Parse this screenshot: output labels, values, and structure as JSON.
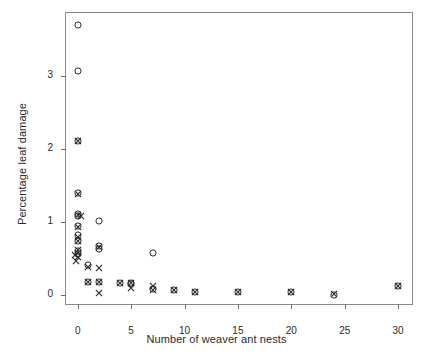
{
  "chart_data": {
    "type": "scatter",
    "title": "",
    "xlabel": "Number of weaver ant nests",
    "ylabel": "Percentage leaf damage",
    "xlim": [
      -1.1,
      31.3
    ],
    "ylim": [
      -0.12,
      3.87
    ],
    "xticks": [
      0,
      5,
      10,
      15,
      20,
      25,
      30
    ],
    "xticklabels": [
      "0",
      "5",
      "10",
      "15",
      "20",
      "25",
      "30"
    ],
    "yticks": [
      0,
      1,
      2,
      3
    ],
    "yticklabels": [
      "0",
      "1",
      "2",
      "3"
    ],
    "grid": false,
    "legend": false,
    "frame": "box",
    "series": [
      {
        "name": "circle-series",
        "marker": "circle",
        "points": [
          {
            "x": 0.0,
            "y": 3.7
          },
          {
            "x": 0.0,
            "y": 3.08
          },
          {
            "x": 0.0,
            "y": 2.12
          },
          {
            "x": 0.0,
            "y": 1.4
          },
          {
            "x": 0.0,
            "y": 1.12
          },
          {
            "x": 0.0,
            "y": 1.09
          },
          {
            "x": 0.0,
            "y": 0.95
          },
          {
            "x": 0.0,
            "y": 0.82
          },
          {
            "x": 0.0,
            "y": 0.74
          },
          {
            "x": 0.0,
            "y": 0.6
          },
          {
            "x": 0.0,
            "y": 0.57
          },
          {
            "x": 1.0,
            "y": 0.41
          },
          {
            "x": 1.0,
            "y": 0.18
          },
          {
            "x": 2.0,
            "y": 1.02
          },
          {
            "x": 2.0,
            "y": 0.67
          },
          {
            "x": 2.0,
            "y": 0.64
          },
          {
            "x": 2.0,
            "y": 0.18
          },
          {
            "x": 4.0,
            "y": 0.17
          },
          {
            "x": 5.0,
            "y": 0.17
          },
          {
            "x": 5.0,
            "y": 0.15
          },
          {
            "x": 7.0,
            "y": 0.58
          },
          {
            "x": 7.0,
            "y": 0.09
          },
          {
            "x": 9.0,
            "y": 0.07
          },
          {
            "x": 11.0,
            "y": 0.04
          },
          {
            "x": 15.0,
            "y": 0.04
          },
          {
            "x": 20.0,
            "y": 0.04
          },
          {
            "x": 24.0,
            "y": 0.01
          },
          {
            "x": 30.0,
            "y": 0.12
          }
        ]
      },
      {
        "name": "cross-series",
        "marker": "x",
        "points": [
          {
            "x": 0.0,
            "y": 2.12
          },
          {
            "x": 0.0,
            "y": 1.39
          },
          {
            "x": 0.0,
            "y": 1.1
          },
          {
            "x": 0.3,
            "y": 1.09
          },
          {
            "x": 0.0,
            "y": 0.94
          },
          {
            "x": 0.0,
            "y": 0.8
          },
          {
            "x": 0.0,
            "y": 0.74
          },
          {
            "x": 0.0,
            "y": 0.62
          },
          {
            "x": 0.0,
            "y": 0.58
          },
          {
            "x": -0.3,
            "y": 0.55
          },
          {
            "x": 0.0,
            "y": 0.52
          },
          {
            "x": -0.2,
            "y": 0.47
          },
          {
            "x": 1.0,
            "y": 0.39
          },
          {
            "x": 1.0,
            "y": 0.18
          },
          {
            "x": 2.0,
            "y": 0.38
          },
          {
            "x": 2.0,
            "y": 0.66
          },
          {
            "x": 2.0,
            "y": 0.18
          },
          {
            "x": 2.0,
            "y": 0.03
          },
          {
            "x": 4.0,
            "y": 0.17
          },
          {
            "x": 5.0,
            "y": 0.17
          },
          {
            "x": 5.0,
            "y": 0.1
          },
          {
            "x": 7.0,
            "y": 0.12
          },
          {
            "x": 7.0,
            "y": 0.07
          },
          {
            "x": 9.0,
            "y": 0.07
          },
          {
            "x": 11.0,
            "y": 0.04
          },
          {
            "x": 15.0,
            "y": 0.04
          },
          {
            "x": 20.0,
            "y": 0.04
          },
          {
            "x": 24.0,
            "y": 0.02
          },
          {
            "x": 30.0,
            "y": 0.12
          }
        ]
      }
    ],
    "marker_color": "#2b2b2b",
    "axis_color": "#8a8a8a",
    "background": "#ffffff"
  }
}
